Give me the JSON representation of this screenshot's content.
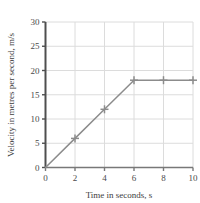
{
  "chart_data": {
    "type": "line",
    "title": "",
    "xlabel": "Time in seconds, s",
    "ylabel": "Velocity in metres per second, m/s",
    "xlim": [
      0,
      10
    ],
    "ylim": [
      0,
      30
    ],
    "xticks": [
      0,
      2,
      4,
      6,
      8,
      10
    ],
    "yticks": [
      0,
      5,
      10,
      15,
      20,
      25,
      30
    ],
    "xtick_labels": [
      "0",
      "2",
      "4",
      "6",
      "8",
      "10"
    ],
    "ytick_labels": [
      "0",
      "5",
      "10",
      "15",
      "20",
      "25",
      "30"
    ],
    "grid": true,
    "legend": false,
    "legend_position": "none",
    "marker": "plus",
    "line_color": "#8c8c8c",
    "grid_color": "#dcdcdc",
    "axis_color": "#4f4f4f",
    "background_color": "#ffffff",
    "x": [
      0,
      2,
      4,
      6,
      8,
      10
    ],
    "values": [
      0,
      6,
      12,
      18,
      18,
      18
    ],
    "series": [
      {
        "name": "Velocity",
        "points": [
          {
            "x": 0,
            "y": 0
          },
          {
            "x": 2,
            "y": 6
          },
          {
            "x": 4,
            "y": 12
          },
          {
            "x": 6,
            "y": 18
          },
          {
            "x": 8,
            "y": 18
          },
          {
            "x": 10,
            "y": 18
          }
        ]
      }
    ],
    "annotations": []
  }
}
